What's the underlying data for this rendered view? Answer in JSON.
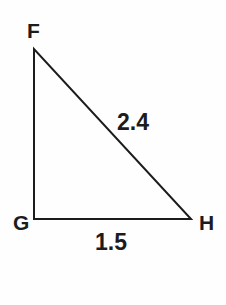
{
  "figure": {
    "background_color": "#fefefe",
    "stroke_color": "#1c1c1c",
    "stroke_width": 2,
    "text_color": "#1c1c1c",
    "vertices": {
      "F": {
        "label": "F",
        "x": 34,
        "y": 49
      },
      "G": {
        "label": "G",
        "x": 34,
        "y": 219
      },
      "H": {
        "label": "H",
        "x": 191,
        "y": 219
      }
    },
    "vertex_labels": {
      "f": "F",
      "g": "G",
      "h": "H"
    },
    "side_labels": {
      "hypotenuse_fh": "2.4",
      "base_gh": "1.5"
    }
  },
  "chart_data": {
    "type": "diagram",
    "shape": "right triangle",
    "points": [
      {
        "name": "F",
        "x": 34,
        "y": 49
      },
      {
        "name": "G",
        "x": 34,
        "y": 219
      },
      {
        "name": "H",
        "x": 191,
        "y": 219
      }
    ],
    "edges": [
      {
        "from": "F",
        "to": "G",
        "label": "",
        "orientation": "vertical"
      },
      {
        "from": "G",
        "to": "H",
        "label": "1.5",
        "orientation": "horizontal"
      },
      {
        "from": "F",
        "to": "H",
        "label": "2.4",
        "orientation": "hypotenuse"
      }
    ],
    "right_angle_at": "G",
    "measured_values": {
      "FH": 2.4,
      "GH": 1.5
    }
  }
}
